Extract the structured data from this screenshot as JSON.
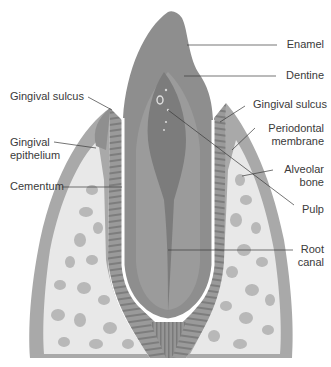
{
  "diagram": {
    "colors": {
      "background": "#ffffff",
      "enamel": "#8f8f8f",
      "dentine": "#9a9a9a",
      "pulp": "#7a7a7a",
      "gingiva": "#a5a5a5",
      "periodontal_membrane": "#8a8a8a",
      "bone_base": "#e6e6e6",
      "bone_spots": "#b4b4b4",
      "leader_line": "#3a3a3a",
      "text": "#3a3a3a"
    },
    "labels": {
      "enamel": "Enamel",
      "dentine": "Dentine",
      "gingival_sulcus_right": "Gingival sulcus",
      "periodontal_membrane": [
        "Periodontal",
        "membrane"
      ],
      "alveolar_bone": [
        "Alveolar",
        "bone"
      ],
      "pulp": "Pulp",
      "root_canal": [
        "Root",
        "canal"
      ],
      "gingival_sulcus_left": "Gingival sulcus",
      "gingival_epithelium": [
        "Gingival",
        "epithelium"
      ],
      "cementum": "Cementum"
    }
  }
}
